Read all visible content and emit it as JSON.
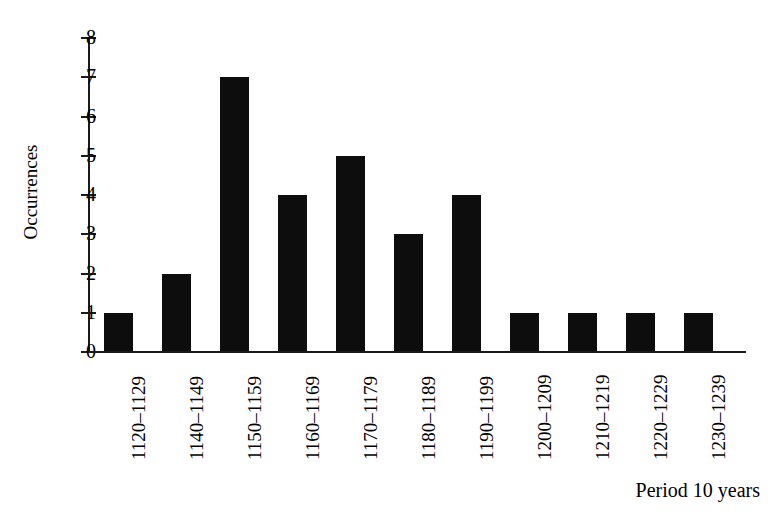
{
  "chart_data": {
    "type": "bar",
    "title": "",
    "subtitle": "",
    "xlabel": "Period 10 years",
    "ylabel": "Occurrences",
    "categories": [
      "1120–1129",
      "1140–1149",
      "1150–1159",
      "1160–1169",
      "1170–1179",
      "1180–1189",
      "1190–1199",
      "1200–1209",
      "1210–1219",
      "1220–1229",
      "1230–1239"
    ],
    "values": [
      1,
      2,
      7,
      4,
      5,
      3,
      4,
      1,
      1,
      1,
      1
    ],
    "ylim": [
      0,
      8
    ],
    "ytick_labels": [
      "8",
      "7",
      "6",
      "5",
      "4",
      "3",
      "2",
      "1",
      "0"
    ],
    "yticks": [
      8,
      7,
      6,
      5,
      4,
      3,
      2,
      1,
      0
    ],
    "grid": false,
    "legend": null,
    "legend_position": "none",
    "bar_color": "#0d0d0d",
    "axis_color": "#1a1a1a",
    "background_color": "#ffffff"
  }
}
